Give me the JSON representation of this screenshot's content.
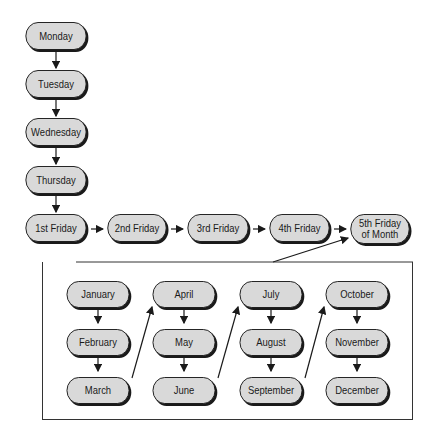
{
  "days": [
    "Monday",
    "Tuesday",
    "Wednesday",
    "Thursday"
  ],
  "fridays": [
    "1st Friday",
    "2nd Friday",
    "3rd Friday",
    "4th Friday",
    "5th Friday\nof Month"
  ],
  "months": {
    "col1": [
      "January",
      "February",
      "March"
    ],
    "col2": [
      "April",
      "May",
      "June"
    ],
    "col3": [
      "July",
      "August",
      "September"
    ],
    "col4": [
      "October",
      "November",
      "December"
    ]
  },
  "colors": {
    "node_fill": "#d9d9d9",
    "stroke": "#1a1a1a"
  }
}
